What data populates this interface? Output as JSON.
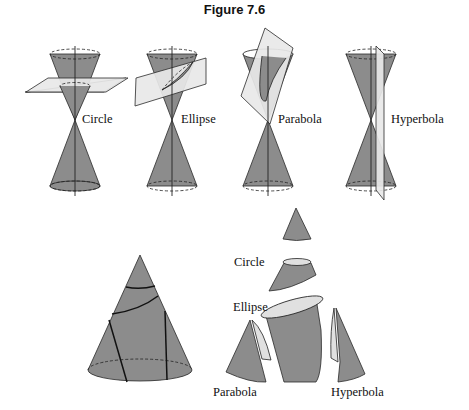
{
  "figure": {
    "title": "Figure 7.6"
  },
  "top_row": {
    "labels": [
      "Circle",
      "Ellipse",
      "Parabola",
      "Hyperbola"
    ]
  },
  "bottom_right": {
    "labels": {
      "circle": "Circle",
      "ellipse": "Ellipse",
      "parabola": "Parabola",
      "hyperbola": "Hyperbola"
    }
  },
  "colors": {
    "cone": "#8c8c8c",
    "plane": "#e6e6e6",
    "stroke": "#222222",
    "section": "#dcdcdc"
  }
}
